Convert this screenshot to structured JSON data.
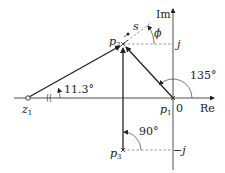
{
  "diagram": {
    "axes": {
      "real_label": "Re",
      "imag_label": "Im",
      "origin_label": "0",
      "pos_j_label": "j",
      "neg_j_label": "−j"
    },
    "points": {
      "z1": {
        "name": "z",
        "sub": "1"
      },
      "p1": {
        "name": "p",
        "sub": "1"
      },
      "p2": {
        "name": "p",
        "sub": "2"
      },
      "p3": {
        "name": "p",
        "sub": "3"
      },
      "s": {
        "name": "s"
      }
    },
    "angles": {
      "z1_angle": "11.3°",
      "p1_angle": "135°",
      "p3_angle": "90°",
      "phi": "ϕ"
    },
    "colors": {
      "line": "#222222",
      "dashed": "#555555"
    }
  }
}
